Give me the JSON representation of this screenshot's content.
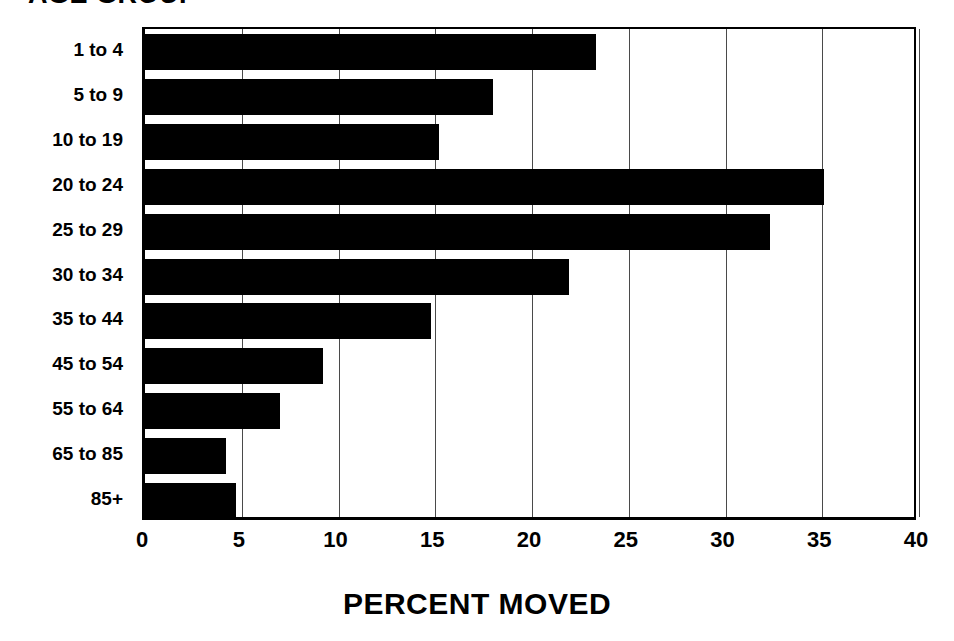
{
  "chart_data": {
    "type": "bar",
    "orientation": "horizontal",
    "title": "AGE GROUP",
    "xlabel": "PERCENT MOVED",
    "ylabel": "AGE GROUP",
    "categories": [
      "1 to 4",
      "5 to 9",
      "10 to 19",
      "20 to 24",
      "25 to 29",
      "30 to 34",
      "35 to 44",
      "45 to 54",
      "55 to 64",
      "65 to 85",
      "85+"
    ],
    "values": [
      23.3,
      18.0,
      15.2,
      35.1,
      32.3,
      21.9,
      14.8,
      9.2,
      7.0,
      4.2,
      4.7
    ],
    "xlim": [
      0,
      40
    ],
    "xticks": [
      0,
      5,
      10,
      15,
      20,
      25,
      30,
      35,
      40
    ],
    "xtick_labels": [
      "0",
      "5",
      "10",
      "15",
      "20",
      "25",
      "30",
      "35",
      "40"
    ],
    "grid": true,
    "grid_axis": "x",
    "legend": false,
    "bar_color": "#000000",
    "background_color": "#FFFFFF"
  },
  "axis_title": {
    "bottom": "PERCENT MOVED"
  }
}
